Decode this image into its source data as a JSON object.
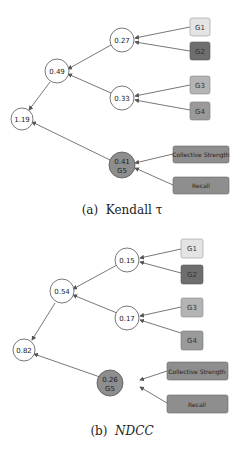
{
  "diagrams": [
    {
      "caption_label": "(a)",
      "caption_text": "Kendall τ",
      "nodes": {
        "g1": "G1",
        "g2": "G2",
        "g3": "G3",
        "g4": "G4",
        "n12": "0.27",
        "n34": "0.33",
        "n1234": "0.49",
        "root": "1.19",
        "g5_value": "0.41",
        "g5_label": "G5",
        "cs": "Collective Strength",
        "recall": "Recall"
      }
    },
    {
      "caption_label": "(b)",
      "caption_text": "NDCC",
      "nodes": {
        "g1": "G1",
        "g2": "G2",
        "g3": "G3",
        "g4": "G4",
        "n12": "0.15",
        "n34": "0.17",
        "n1234": "0.54",
        "root": "0.82",
        "g5_value": "0.26",
        "g5_label": "G5",
        "cs": "Collective Strength",
        "recall": "Recall"
      }
    }
  ],
  "colors": {
    "g1": "#e4e4e4",
    "g2": "#6e6e6e",
    "g3": "#b4b4b4",
    "g4": "#9a9a9a",
    "g5": "#8e8e8e",
    "cs": "#8e8e8e",
    "recall": "#8e8e8e",
    "edge": "#555555"
  }
}
